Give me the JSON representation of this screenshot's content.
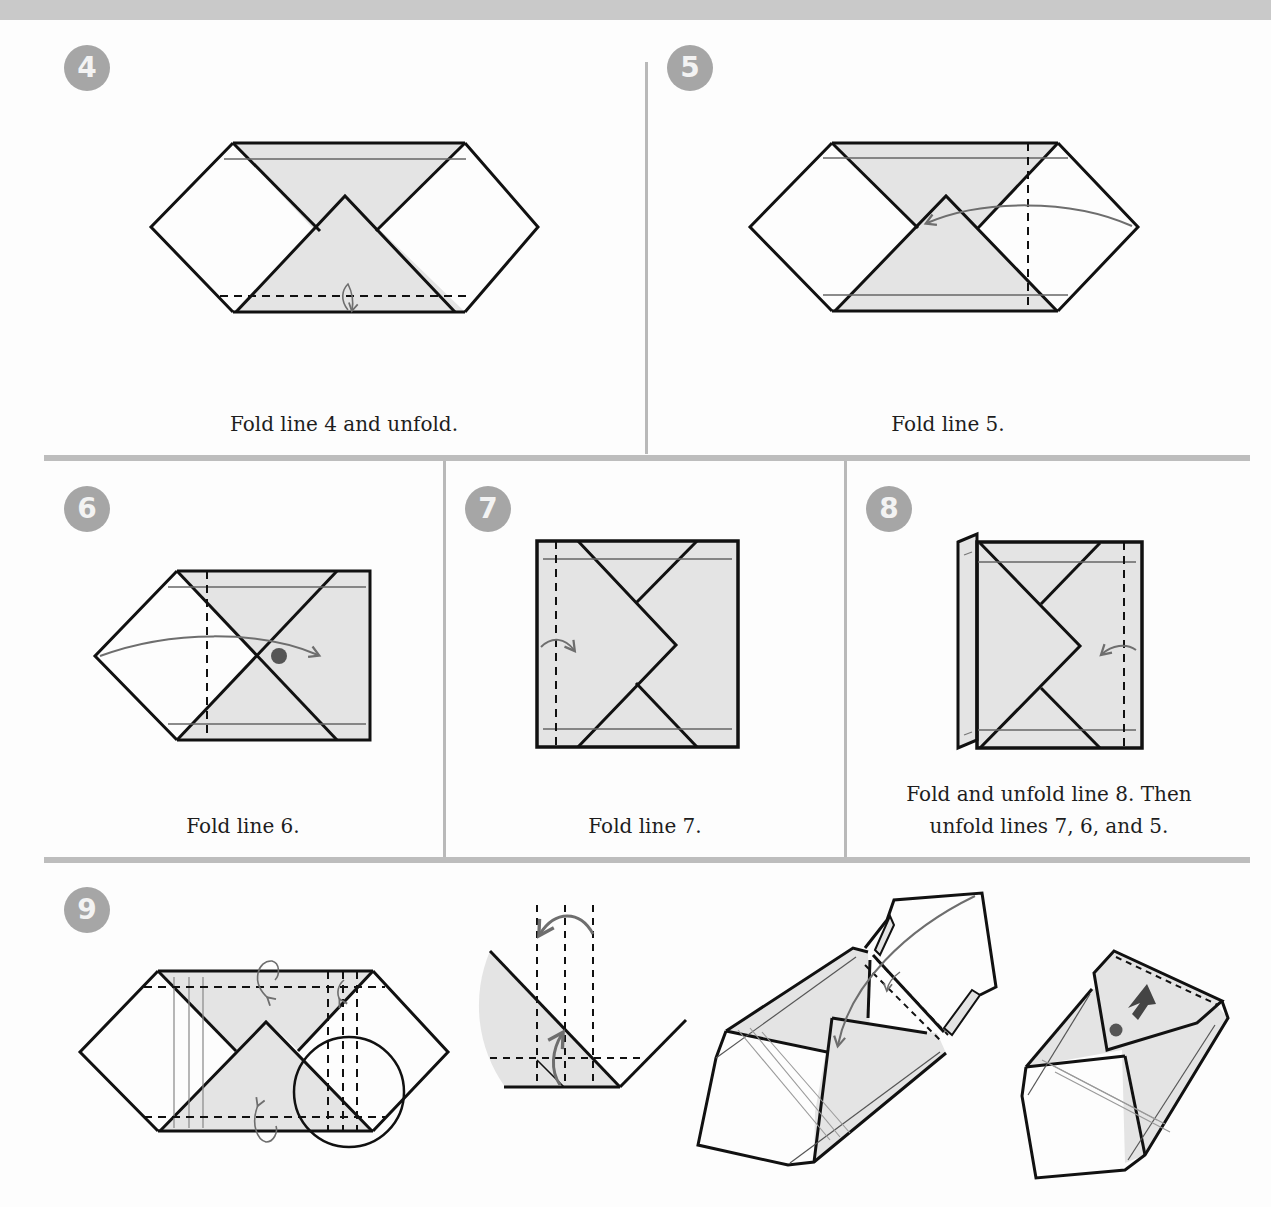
{
  "colors": {
    "paper_shade": "#e4e4e4",
    "line": "#111111",
    "arrow": "#6e6e6e",
    "badge_bg": "#a6a6a6",
    "badge_text": "#f3f3f3",
    "divider": "#bdbdbd"
  },
  "steps": [
    {
      "number": "4",
      "caption": "Fold line 4 and unfold."
    },
    {
      "number": "5",
      "caption": "Fold line 5."
    },
    {
      "number": "6",
      "caption": "Fold line 6."
    },
    {
      "number": "7",
      "caption": "Fold line 7."
    },
    {
      "number": "8",
      "caption_line1": "Fold and unfold line 8. Then",
      "caption_line2": "unfold lines 7, 6, and 5."
    },
    {
      "number": "9",
      "caption": ""
    }
  ],
  "icons": {
    "fold_arrow": "curved-arrow",
    "reference_dot": "filled-circle",
    "push_arrow": "block-arrow"
  }
}
